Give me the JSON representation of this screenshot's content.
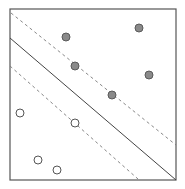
{
  "diagram": {
    "type": "svm-margin-illustration",
    "frame": {
      "x1": 10,
      "y1": 9,
      "x2": 176,
      "y2": 180,
      "stroke": "#555555"
    },
    "lines": [
      {
        "name": "upper-margin",
        "x1": 11,
        "y1": 13,
        "x2": 176,
        "y2": 145,
        "style": "dashed",
        "stroke": "#7a7a7a"
      },
      {
        "name": "decision-boundary",
        "x1": 10,
        "y1": 38,
        "x2": 176,
        "y2": 180,
        "style": "solid",
        "stroke": "#444444"
      },
      {
        "name": "lower-margin",
        "x1": 10,
        "y1": 66,
        "x2": 138,
        "y2": 179,
        "style": "dashed",
        "stroke": "#7a7a7a"
      }
    ],
    "points": {
      "filled_color": "#8a8a8a",
      "filled_stroke": "#5a5a5a",
      "hollow_stroke": "#555555",
      "radius": 4,
      "positive_class": [
        {
          "x": 66,
          "y": 37
        },
        {
          "x": 139,
          "y": 28
        },
        {
          "x": 75,
          "y": 66
        },
        {
          "x": 149,
          "y": 75
        },
        {
          "x": 112,
          "y": 95
        }
      ],
      "negative_class": [
        {
          "x": 20,
          "y": 113
        },
        {
          "x": 75,
          "y": 123
        },
        {
          "x": 38,
          "y": 160
        },
        {
          "x": 57,
          "y": 170
        }
      ]
    }
  }
}
